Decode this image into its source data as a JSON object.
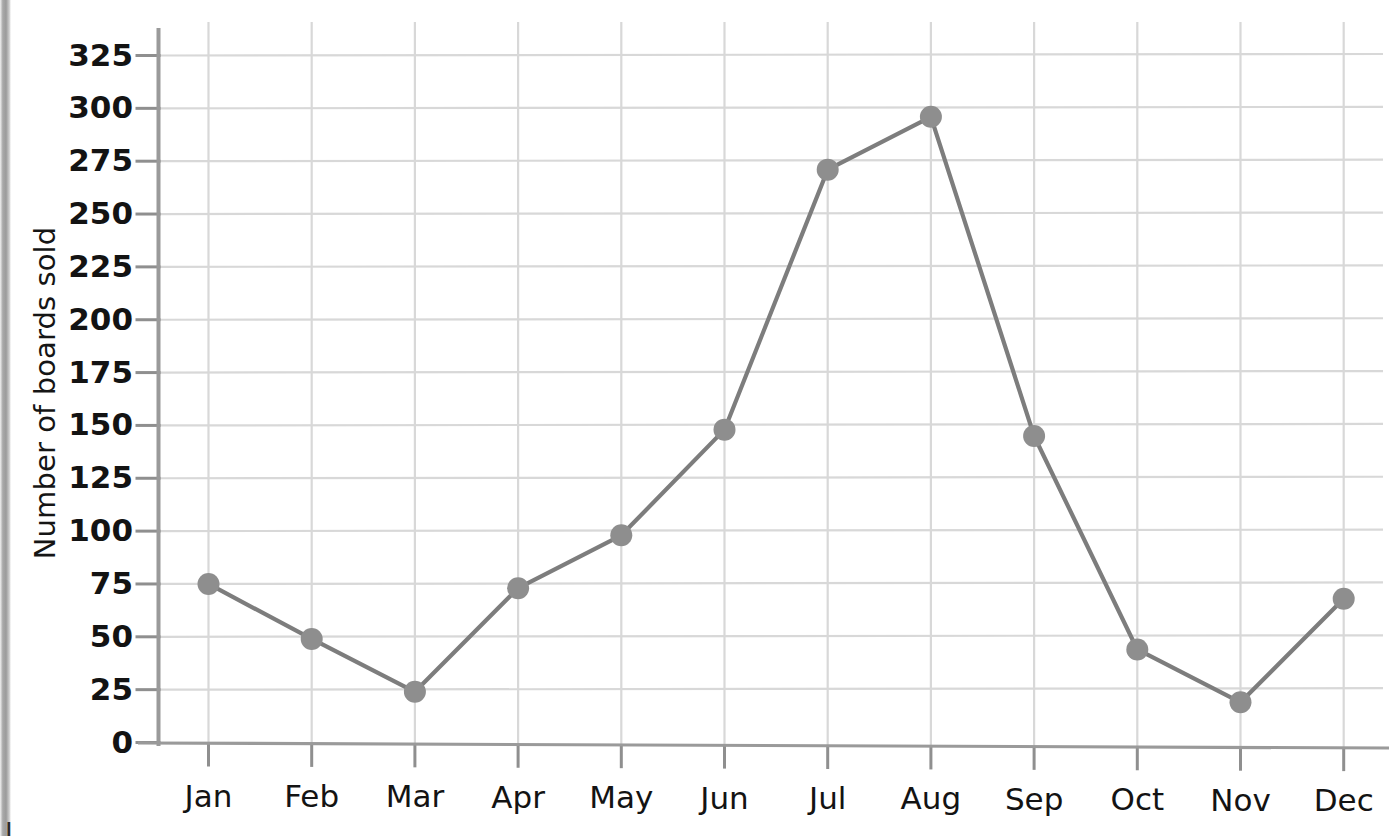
{
  "chart_data": {
    "type": "line",
    "title": "",
    "xlabel": "",
    "ylabel": "Number of boards sold",
    "categories": [
      "Jan",
      "Feb",
      "Mar",
      "Apr",
      "May",
      "Jun",
      "Jul",
      "Aug",
      "Sep",
      "Oct",
      "Nov",
      "Dec"
    ],
    "values": [
      75,
      49,
      24,
      73,
      98,
      148,
      271,
      296,
      145,
      44,
      19,
      68
    ],
    "series": [
      {
        "name": "Number of boards sold",
        "values": [
          75,
          49,
          24,
          73,
          98,
          148,
          271,
          296,
          145,
          44,
          19,
          68
        ]
      }
    ],
    "ylim": [
      0,
      325
    ],
    "y_ticks": [
      0,
      25,
      50,
      75,
      100,
      125,
      150,
      175,
      200,
      225,
      250,
      275,
      300,
      325
    ],
    "y_tick_labels": [
      "0",
      "25",
      "50",
      "75",
      "100",
      "125",
      "150",
      "175",
      "200",
      "225",
      "250",
      "275",
      "300",
      "325"
    ],
    "grid": true,
    "legend": "none",
    "marker": "circle",
    "line_color": "#7d7d7d",
    "marker_color": "#8e8e8e",
    "grid_color": "#d8d8d8",
    "axis_color": "#9a9a9a",
    "tick_color": "#8f8f8f",
    "text_color": "#131313"
  },
  "axes": {
    "y_title": "Number of boards sold",
    "y_tick_labels": [
      "325",
      "300",
      "275",
      "250",
      "225",
      "200",
      "175",
      "150",
      "125",
      "100",
      "75",
      "50",
      "25",
      "0"
    ],
    "x_tick_labels": [
      "Jan",
      "Feb",
      "Mar",
      "Apr",
      "May",
      "Jun",
      "Jul",
      "Aug",
      "Sep",
      "Oct",
      "Nov",
      "Dec"
    ]
  },
  "page": {
    "bottom_bleed_text": "J"
  }
}
